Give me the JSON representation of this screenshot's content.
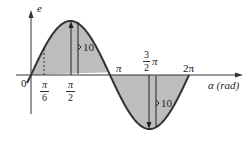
{
  "chart_data": {
    "type": "line",
    "title": "",
    "xlabel": "α (rad)",
    "ylabel": "e",
    "function": "e = 10 sin(α)",
    "amplitude": 10,
    "x_range": [
      0,
      6.2832
    ],
    "y_range": [
      -10,
      10
    ],
    "grid": false,
    "legend": null,
    "fill": "area between curve and axis shaded gray",
    "x_ticks": [
      {
        "value": 0,
        "label": "0"
      },
      {
        "value": 0.5236,
        "label": "π/6"
      },
      {
        "value": 1.5708,
        "label": "π/2"
      },
      {
        "value": 3.1416,
        "label": "π"
      },
      {
        "value": 4.7124,
        "label": "3/2 π"
      },
      {
        "value": 6.2832,
        "label": "2π"
      }
    ],
    "x": [
      0,
      0.5236,
      1.5708,
      3.1416,
      4.7124,
      6.2832
    ],
    "series": [
      {
        "name": "e",
        "values": [
          0,
          5,
          10,
          0,
          -10,
          0
        ]
      }
    ],
    "annotations": [
      {
        "type": "dimension",
        "at": "π/2",
        "label": "10",
        "meaning": "positive peak amplitude"
      },
      {
        "type": "dimension",
        "at": "3/2 π",
        "label": "10",
        "meaning": "negative peak amplitude"
      },
      {
        "type": "dashed-line",
        "at": "π/6"
      }
    ]
  },
  "labels": {
    "y_axis": "e",
    "x_axis": "α (rad)",
    "origin": "0",
    "pi_over_6_num": "π",
    "pi_over_6_den": "6",
    "pi_over_2_num": "π",
    "pi_over_2_den": "2",
    "pi": "π",
    "three_halves_num": "3",
    "three_halves_den": "2",
    "three_halves_pi": "π",
    "two_pi": "2π",
    "amp_top": "10",
    "amp_bottom": "10"
  },
  "colors": {
    "fill": "#bdbdbd",
    "stroke": "#333333",
    "axis": "#333333",
    "background": "#ffffff"
  }
}
